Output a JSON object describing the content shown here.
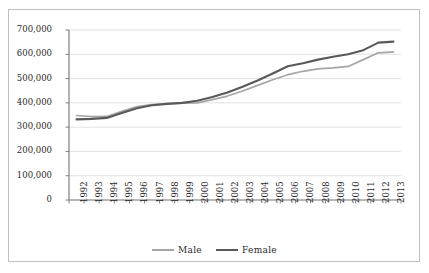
{
  "chart_data": {
    "type": "line",
    "title": "",
    "xlabel": "",
    "ylabel": "",
    "categories": [
      "1992",
      "1993",
      "1994",
      "1995",
      "1996",
      "1997",
      "1998",
      "1999",
      "2000",
      "2001",
      "2002",
      "2003",
      "2004",
      "2005",
      "2006",
      "2007",
      "2008",
      "2009",
      "2010",
      "2011",
      "2012",
      "2013"
    ],
    "ylim": [
      0,
      700000
    ],
    "ytick_labels": [
      "700,000",
      "600,000",
      "500,000",
      "400,000",
      "300,000",
      "200,000",
      "100,000",
      "0"
    ],
    "ytick_values": [
      700000,
      600000,
      500000,
      400000,
      300000,
      200000,
      100000,
      0
    ],
    "grid": true,
    "legend_position": "bottom",
    "series": [
      {
        "name": "Male",
        "color": "#a6a6a6",
        "values": [
          348000,
          343000,
          344000,
          365000,
          385000,
          393000,
          397000,
          399000,
          400000,
          413000,
          428000,
          449000,
          472000,
          495000,
          516000,
          530000,
          540000,
          544000,
          550000,
          578000,
          606000,
          610000
        ]
      },
      {
        "name": "Female",
        "color": "#595959",
        "values": [
          332000,
          334000,
          338000,
          358000,
          378000,
          390000,
          396000,
          400000,
          409000,
          424000,
          443000,
          466000,
          492000,
          521000,
          551000,
          563000,
          578000,
          590000,
          600000,
          617000,
          648000,
          652000
        ]
      }
    ]
  },
  "legend": {
    "items": [
      {
        "label": "Male"
      },
      {
        "label": "Female"
      }
    ]
  }
}
